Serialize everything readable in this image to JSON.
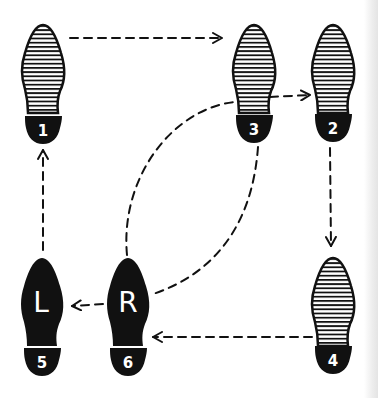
{
  "diagram": {
    "type": "dance-step-footprints",
    "colors": {
      "ink": "#111111",
      "paper": "#ffffff",
      "hatch": "#111111"
    },
    "footprints": [
      {
        "id": "1",
        "step_label": "1",
        "style": "hatched",
        "position": "top-left"
      },
      {
        "id": "3",
        "step_label": "3",
        "style": "hatched",
        "position": "top-middle"
      },
      {
        "id": "2",
        "step_label": "2",
        "style": "hatched",
        "position": "top-right"
      },
      {
        "id": "4",
        "step_label": "4",
        "style": "hatched",
        "position": "bottom-right"
      },
      {
        "id": "5",
        "step_label": "5",
        "style": "solid",
        "foot_letter": "L",
        "position": "bottom-left"
      },
      {
        "id": "6",
        "step_label": "6",
        "style": "solid",
        "foot_letter": "R",
        "position": "bottom-middle"
      }
    ],
    "paths": [
      {
        "from": "1",
        "to": "3",
        "style": "dashed-arrow"
      },
      {
        "from": "3",
        "to": "2",
        "style": "dashed-arrow"
      },
      {
        "from": "2",
        "to": "4",
        "style": "dashed-arrow"
      },
      {
        "from": "4",
        "to": "6",
        "style": "dashed-arrow"
      },
      {
        "from": "6",
        "to": "5",
        "style": "dashed-arrow"
      },
      {
        "from": "5",
        "to": "1",
        "style": "dashed-arrow"
      },
      {
        "from": "6",
        "to": "3",
        "style": "dashed-curve"
      },
      {
        "from": "3",
        "to": "6",
        "style": "dashed-curve"
      }
    ]
  }
}
